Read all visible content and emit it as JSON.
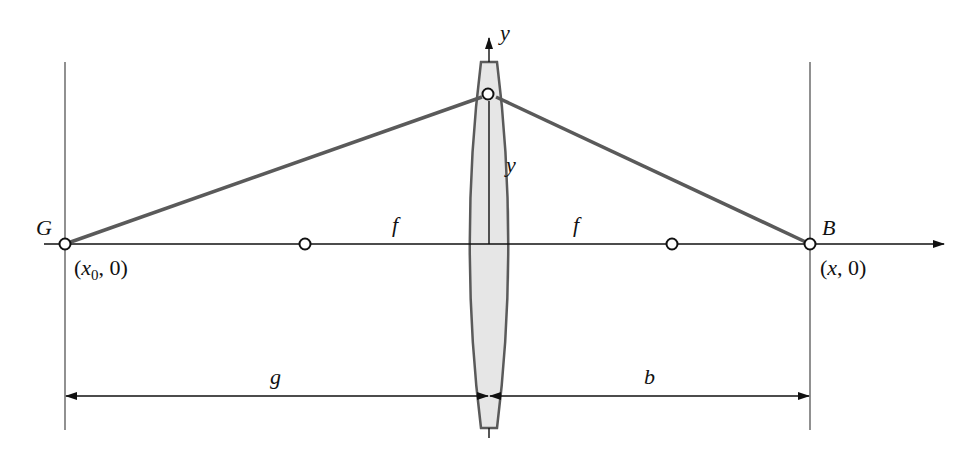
{
  "diagram": {
    "type": "thin-lens-imaging",
    "colors": {
      "axis": "#111111",
      "ray": "#5a5a5a",
      "lens_fill": "#e6e6e6",
      "lens_stroke": "#5a5a5a",
      "point_fill": "#ffffff"
    },
    "labels": {
      "object_point": "G",
      "object_coord_open": "(",
      "object_coord_x": "x",
      "object_coord_sub": "0",
      "object_coord_rest": ", 0)",
      "image_point": "B",
      "image_coord_open": "(",
      "image_coord_x": "x",
      "image_coord_rest": ", 0)",
      "y_axis": "y",
      "lens_point_height": "y",
      "focal_left": "f",
      "focal_right": "f",
      "object_distance": "g",
      "image_distance": "b"
    },
    "points": [
      {
        "name": "G",
        "role": "object point",
        "x": 65,
        "y": 244
      },
      {
        "name": "F-left",
        "role": "left focal point",
        "x": 305,
        "y": 244
      },
      {
        "name": "lens-point",
        "role": "point on lens at height y",
        "x": 488,
        "y": 94
      },
      {
        "name": "F-right",
        "role": "right focal point",
        "x": 672,
        "y": 244
      },
      {
        "name": "B",
        "role": "image point",
        "x": 810,
        "y": 244
      }
    ]
  }
}
